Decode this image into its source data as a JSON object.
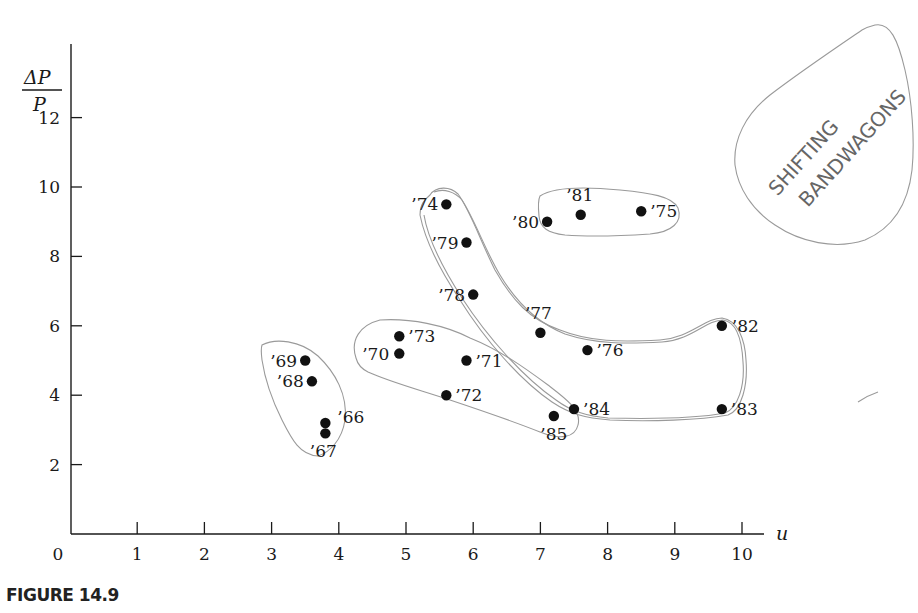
{
  "caption": "FIGURE 14.9",
  "annotation": {
    "text_line1": "SHIFTING",
    "text_line2": "BANDWAGONS"
  },
  "chart_data": {
    "type": "scatter",
    "title": "",
    "xlabel": "u",
    "ylabel": "ΔP / P",
    "ylabel_numerator": "ΔP",
    "ylabel_denominator": "P",
    "xlim": [
      0,
      10.5
    ],
    "ylim": [
      0,
      13.5
    ],
    "x_ticks": [
      0,
      1,
      2,
      3,
      4,
      5,
      6,
      7,
      8,
      9,
      10
    ],
    "y_ticks": [
      2,
      4,
      6,
      8,
      10,
      12
    ],
    "grid": false,
    "legend": null,
    "points": [
      {
        "label": "'66",
        "u": 3.8,
        "v": 3.2
      },
      {
        "label": "'67",
        "u": 3.8,
        "v": 2.9
      },
      {
        "label": "'68",
        "u": 3.6,
        "v": 4.4
      },
      {
        "label": "'69",
        "u": 3.5,
        "v": 5.0
      },
      {
        "label": "'70",
        "u": 4.9,
        "v": 5.2
      },
      {
        "label": "'71",
        "u": 5.9,
        "v": 5.0
      },
      {
        "label": "'72",
        "u": 5.6,
        "v": 4.0
      },
      {
        "label": "'73",
        "u": 4.9,
        "v": 5.7
      },
      {
        "label": "'74",
        "u": 5.6,
        "v": 9.5
      },
      {
        "label": "'75",
        "u": 8.5,
        "v": 9.3
      },
      {
        "label": "'76",
        "u": 7.7,
        "v": 5.3
      },
      {
        "label": "'77",
        "u": 7.0,
        "v": 5.8
      },
      {
        "label": "'78",
        "u": 6.0,
        "v": 6.9
      },
      {
        "label": "'79",
        "u": 5.9,
        "v": 8.4
      },
      {
        "label": "'80",
        "u": 7.1,
        "v": 9.0
      },
      {
        "label": "'81",
        "u": 7.6,
        "v": 9.2
      },
      {
        "label": "'82",
        "u": 9.7,
        "v": 6.0
      },
      {
        "label": "'83",
        "u": 9.7,
        "v": 3.6
      },
      {
        "label": "'84",
        "u": 7.5,
        "v": 3.6
      },
      {
        "label": "'85",
        "u": 7.2,
        "v": 3.4
      }
    ],
    "hand_drawn_groups": [
      [
        "'66",
        "'67",
        "'68",
        "'69"
      ],
      [
        "'70",
        "'71",
        "'72",
        "'73",
        "'85"
      ],
      [
        "'74",
        "'79",
        "'78",
        "'77",
        "'76",
        "'82",
        "'83",
        "'84"
      ],
      [
        "'80",
        "'81",
        "'75"
      ]
    ],
    "annotations": [
      "SHIFTING BANDWAGONS"
    ]
  }
}
